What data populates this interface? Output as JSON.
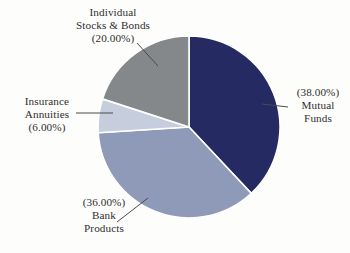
{
  "chart_data": {
    "type": "pie",
    "title": "",
    "subtitle": "",
    "xlabel": "",
    "ylabel": "",
    "legend_position": "none",
    "grid": false,
    "labels_show_percent": true,
    "start_angle_deg": 0,
    "direction": "clockwise",
    "categories": [
      "Mutual Funds",
      "Bank Products",
      "Insurance Annuities",
      "Individual Stocks & Bonds"
    ],
    "values": [
      38.0,
      36.0,
      6.0,
      20.0
    ],
    "value_labels": [
      "(38.00%)",
      "(36.00%)",
      "(6.00%)",
      "(20.00%)"
    ],
    "colors": [
      "#252a63",
      "#8f99b8",
      "#c6cedd",
      "#85888a"
    ],
    "slices": [
      {
        "name": "Mutual Funds",
        "value": 38.0,
        "percent_label": "(38.00%)",
        "color": "#252a63",
        "start_deg": 0,
        "end_deg": 136.8
      },
      {
        "name": "Bank Products",
        "value": 36.0,
        "percent_label": "(36.00%)",
        "color": "#8f99b8",
        "start_deg": 136.8,
        "end_deg": 266.4
      },
      {
        "name": "Insurance Annuities",
        "value": 6.0,
        "percent_label": "(6.00%)",
        "color": "#c6cedd",
        "start_deg": 266.4,
        "end_deg": 288.0
      },
      {
        "name": "Individual Stocks & Bonds",
        "value": 20.0,
        "percent_label": "(20.00%)",
        "color": "#85888a",
        "start_deg": 288.0,
        "end_deg": 360.0
      }
    ]
  },
  "callouts": {
    "stocks_bonds": {
      "line1": "Individual",
      "line2": "Stocks & Bonds",
      "line3": "(20.00%)"
    },
    "insurance": {
      "line1": "Insurance",
      "line2": "Annuities",
      "line3": "(6.00%)"
    },
    "mutual": {
      "line1": "(38.00%)",
      "line2": "Mutual",
      "line3": "Funds"
    },
    "bank": {
      "line1": "(36.00%)",
      "line2": "Bank",
      "line3": "Products"
    }
  },
  "style": {
    "background": "#fdfdfc",
    "text_color": "#2f2f2f",
    "leader_line_color": "#4a4a4a",
    "slice_separator_color": "#ffffff"
  }
}
